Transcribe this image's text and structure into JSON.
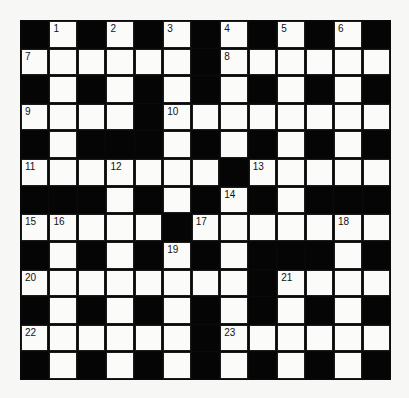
{
  "puzzle": {
    "rows": 13,
    "cols": 13,
    "colors": {
      "block": "#050505",
      "cell": "#fbfbfa",
      "line": "#1a1a1a"
    },
    "layout": [
      "#.#.#.#.#.#.#",
      "......#......",
      "#.#.#.#.#.#.#",
      "....#........",
      "#.###.#.#.#.#",
      ".......#.....",
      "###.#.#.#.###",
      ".....#.......",
      "#.#.#.#.###.#",
      "........#....",
      "#.#.#.#.#.#.#",
      "......#......",
      "#.#.#.#.#.#.#"
    ],
    "numbers": [
      {
        "r": 0,
        "c": 1,
        "n": "1"
      },
      {
        "r": 0,
        "c": 3,
        "n": "2"
      },
      {
        "r": 0,
        "c": 5,
        "n": "3"
      },
      {
        "r": 0,
        "c": 7,
        "n": "4"
      },
      {
        "r": 0,
        "c": 9,
        "n": "5"
      },
      {
        "r": 0,
        "c": 11,
        "n": "6"
      },
      {
        "r": 1,
        "c": 0,
        "n": "7"
      },
      {
        "r": 1,
        "c": 7,
        "n": "8"
      },
      {
        "r": 3,
        "c": 0,
        "n": "9"
      },
      {
        "r": 3,
        "c": 5,
        "n": "10"
      },
      {
        "r": 5,
        "c": 0,
        "n": "11"
      },
      {
        "r": 5,
        "c": 3,
        "n": "12"
      },
      {
        "r": 5,
        "c": 8,
        "n": "13"
      },
      {
        "r": 6,
        "c": 7,
        "n": "14"
      },
      {
        "r": 7,
        "c": 0,
        "n": "15"
      },
      {
        "r": 7,
        "c": 1,
        "n": "16"
      },
      {
        "r": 7,
        "c": 6,
        "n": "17"
      },
      {
        "r": 7,
        "c": 11,
        "n": "18"
      },
      {
        "r": 8,
        "c": 5,
        "n": "19"
      },
      {
        "r": 9,
        "c": 0,
        "n": "20"
      },
      {
        "r": 9,
        "c": 9,
        "n": "21"
      },
      {
        "r": 11,
        "c": 0,
        "n": "22"
      },
      {
        "r": 11,
        "c": 7,
        "n": "23"
      }
    ]
  }
}
